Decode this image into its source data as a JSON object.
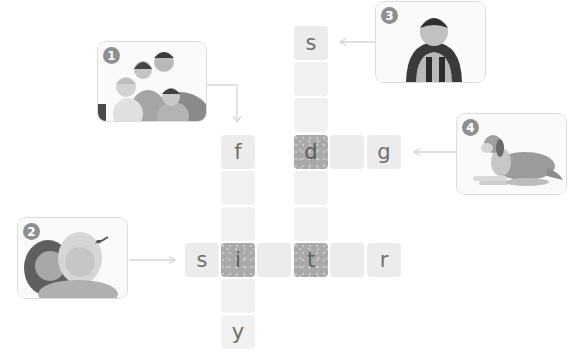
{
  "puzzle": {
    "type": "picture-crossword",
    "clues": [
      {
        "number": "1",
        "image": "family-photo",
        "direction": "down",
        "answer_pattern": [
          "f",
          "",
          "",
          "i",
          "",
          "y"
        ]
      },
      {
        "number": "2",
        "image": "sister-photo",
        "direction": "across",
        "answer_pattern": [
          "s",
          "i",
          "",
          "t",
          "",
          "r"
        ]
      },
      {
        "number": "3",
        "image": "student-photo",
        "direction": "down",
        "answer_pattern": [
          "s",
          "",
          "",
          "d",
          "",
          "",
          "t"
        ]
      },
      {
        "number": "4",
        "image": "dog-photo",
        "direction": "across",
        "answer_pattern": [
          "d",
          "",
          "g"
        ]
      }
    ],
    "cells": {
      "c1": "s",
      "c2": "",
      "c3": "",
      "c4": "f",
      "c5": "d",
      "c6": "",
      "c7": "g",
      "c8": "",
      "c9": "",
      "c10": "",
      "c11": "",
      "c12": "s",
      "c13": "i",
      "c14": "",
      "c15": "t",
      "c16": "",
      "c17": "r",
      "c18": "",
      "c19": "y"
    }
  },
  "colors": {
    "cell": "#ececec",
    "shared_cell": "#a9a9a9",
    "badge": "#8f8f8f",
    "arrow": "#d6d6d6"
  }
}
